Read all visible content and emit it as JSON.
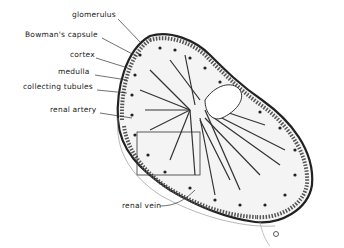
{
  "diagram": {
    "labels": [
      {
        "id": "glomerulus",
        "text": "glomerulus",
        "x": 72,
        "y": 14
      },
      {
        "id": "bowmans-capsule",
        "text": "Bowman's capsule",
        "x": 25,
        "y": 33
      },
      {
        "id": "cortex",
        "text": "cortex",
        "x": 70,
        "y": 53
      },
      {
        "id": "medulla",
        "text": "medulla",
        "x": 58,
        "y": 70
      },
      {
        "id": "collecting-tubules",
        "text": "collecting tubules",
        "x": 23,
        "y": 85
      },
      {
        "id": "renal-artery",
        "text": "renal artery",
        "x": 50,
        "y": 108
      },
      {
        "id": "renal-vein",
        "text": "renal vein",
        "x": 122,
        "y": 204
      }
    ],
    "colors": {
      "ink": "#222222",
      "background": "#ffffff"
    }
  }
}
